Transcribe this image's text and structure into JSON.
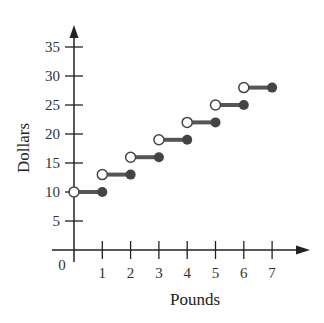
{
  "chart_data": {
    "type": "line",
    "subtype": "step",
    "title": "",
    "xlabel": "Pounds",
    "ylabel": "Dollars",
    "xlim": [
      0,
      7.8
    ],
    "ylim": [
      0,
      37
    ],
    "x_ticks": [
      1,
      2,
      3,
      4,
      5,
      6,
      7
    ],
    "y_ticks": [
      5,
      10,
      15,
      20,
      25,
      30,
      35
    ],
    "origin_label": "0",
    "grid": false,
    "legend": null,
    "segments": [
      {
        "x_start": 0,
        "x_end": 1,
        "y": 10,
        "open_start": true,
        "closed_end": true
      },
      {
        "x_start": 1,
        "x_end": 2,
        "y": 13,
        "open_start": true,
        "closed_end": true
      },
      {
        "x_start": 2,
        "x_end": 3,
        "y": 16,
        "open_start": true,
        "closed_end": true
      },
      {
        "x_start": 3,
        "x_end": 4,
        "y": 19,
        "open_start": true,
        "closed_end": true
      },
      {
        "x_start": 4,
        "x_end": 5,
        "y": 22,
        "open_start": true,
        "closed_end": true
      },
      {
        "x_start": 5,
        "x_end": 6,
        "y": 25,
        "open_start": true,
        "closed_end": true
      },
      {
        "x_start": 6,
        "x_end": 7,
        "y": 28,
        "open_start": true,
        "closed_end": true
      }
    ],
    "colors": {
      "axis": "#222222",
      "segment": "#555555",
      "closed_dot": "#444444",
      "open_dot_fill": "#ffffff"
    }
  }
}
